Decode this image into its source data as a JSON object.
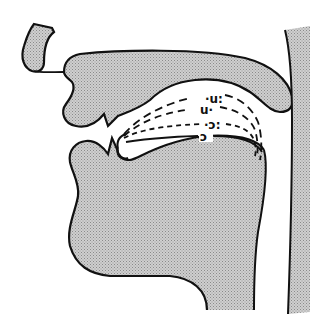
{
  "diagram": {
    "type": "sagittal-section-vocal-tract",
    "colors": {
      "tissue_fill": "#c4c4c4",
      "outline": "#111111",
      "background": "#ffffff"
    },
    "vowel_labels": [
      {
        "id": "u-long",
        "text": "·u:",
        "line_style": "long-dash"
      },
      {
        "id": "u-short",
        "text": "u·",
        "line_style": "dash"
      },
      {
        "id": "open-o-long",
        "text": "·ɔ:",
        "line_style": "short-dash"
      },
      {
        "id": "open-o-short",
        "text": "ɔ",
        "line_style": "solid"
      }
    ]
  }
}
